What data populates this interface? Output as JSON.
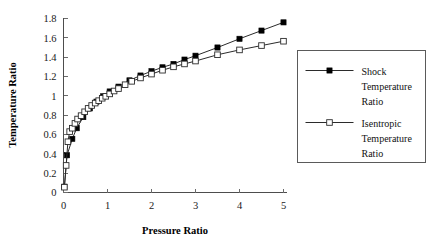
{
  "chart_data": {
    "type": "line",
    "title": "",
    "xlabel": "Pressure Ratio",
    "ylabel": "Temperature Ratio",
    "xlim": [
      0,
      5
    ],
    "ylim": [
      0,
      1.8
    ],
    "xticks": [
      "0",
      "1",
      "2",
      "3",
      "4",
      "5"
    ],
    "xtick_values": [
      0,
      1,
      2,
      3,
      4,
      5
    ],
    "yticks": [
      "0",
      "0.2",
      "0.4",
      "0.6",
      "0.8",
      "1",
      "1.2",
      "1.4",
      "1.6",
      "1.8"
    ],
    "ytick_values": [
      0,
      0.2,
      0.4,
      0.6,
      0.8,
      1,
      1.2,
      1.4,
      1.6,
      1.8
    ],
    "grid": false,
    "legend_position": "right-outside",
    "series": [
      {
        "name": "Shock Temperature Ratio",
        "marker": "filled-square",
        "color": "#000000",
        "x": [
          0.02,
          0.08,
          0.2,
          0.3,
          0.45,
          0.6,
          0.75,
          0.9,
          1.05,
          1.25,
          1.5,
          1.75,
          2.0,
          2.25,
          2.5,
          2.75,
          3.0,
          3.5,
          4.0,
          4.5,
          5.0
        ],
        "y": [
          0.06,
          0.385,
          0.555,
          0.665,
          0.78,
          0.87,
          0.94,
          0.995,
          1.045,
          1.095,
          1.16,
          1.21,
          1.255,
          1.295,
          1.33,
          1.375,
          1.415,
          1.5,
          1.59,
          1.675,
          1.76
        ]
      },
      {
        "name": "Isentropic Temperature Ratio",
        "marker": "open-square",
        "color": "#2b2b2b",
        "x": [
          0.02,
          0.06,
          0.1,
          0.14,
          0.2,
          0.26,
          0.32,
          0.4,
          0.48,
          0.56,
          0.64,
          0.72,
          0.8,
          0.88,
          0.96,
          1.05,
          1.15,
          1.25,
          1.4,
          1.55,
          1.75,
          2.0,
          2.25,
          2.5,
          2.75,
          3.0,
          3.5,
          4.0,
          4.5,
          5.0
        ],
        "y": [
          0.055,
          0.28,
          0.525,
          0.63,
          0.665,
          0.715,
          0.76,
          0.795,
          0.835,
          0.87,
          0.9,
          0.925,
          0.95,
          0.975,
          0.995,
          1.02,
          1.05,
          1.075,
          1.115,
          1.15,
          1.185,
          1.225,
          1.265,
          1.3,
          1.33,
          1.36,
          1.425,
          1.475,
          1.52,
          1.565
        ]
      }
    ],
    "legend": [
      {
        "marker": "filled-square",
        "lines": [
          "Shock",
          "Temperature",
          "Ratio"
        ]
      },
      {
        "marker": "open-square",
        "lines": [
          "Isentropic",
          "Temperature",
          "Ratio"
        ]
      }
    ]
  }
}
